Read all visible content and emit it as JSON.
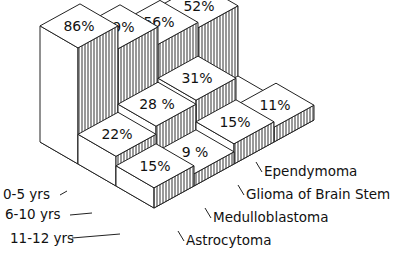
{
  "chart_data": {
    "type": "bar",
    "subtype": "3d-isometric-grouped",
    "title": "",
    "categories": [
      "Astrocytoma",
      "Medulloblastoma",
      "Glioma of Brain Stem",
      "Ependymoma"
    ],
    "series": [
      {
        "name": "0-5 yrs",
        "values": [
          86,
          69,
          56,
          52
        ],
        "labels": [
          "86%",
          "69%",
          "56%",
          "52%"
        ]
      },
      {
        "name": "6-10 yrs",
        "values": [
          22,
          28,
          31,
          null
        ],
        "labels": [
          "22%",
          "28 %",
          "31%",
          ""
        ]
      },
      {
        "name": "11-12 yrs",
        "values": [
          15,
          9,
          15,
          11
        ],
        "labels": [
          "15%",
          "9 %",
          "15%",
          "11%"
        ]
      }
    ],
    "xlabel": "",
    "ylabel": "",
    "unit": "%",
    "grid": false,
    "legend": "row labels on left (age groups), column labels on right (tumor types)"
  },
  "row_labels": [
    "0-5 yrs",
    "6-10 yrs",
    "11-12 yrs"
  ],
  "column_labels": [
    "Astrocytoma",
    "Medulloblastoma",
    "Glioma of Brain Stem",
    "Ependymoma"
  ]
}
